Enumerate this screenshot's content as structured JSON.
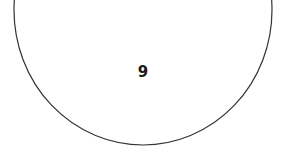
{
  "diagram": {
    "shape": "circle",
    "node_label": "9",
    "stroke_color": "#333333",
    "fill_color": "#ffffff"
  }
}
